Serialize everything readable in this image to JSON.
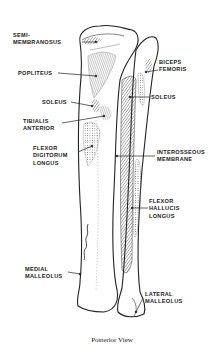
{
  "figure": {
    "caption": "Posterior View",
    "signature": "illustrator signature"
  },
  "labels_left": [
    {
      "id": "semimembranosus",
      "lines": [
        "SEMI-",
        "MEMBRANOSUS"
      ]
    },
    {
      "id": "popliteus",
      "lines": [
        "POPLITEUS"
      ]
    },
    {
      "id": "soleus-left",
      "lines": [
        "SOLEUS"
      ]
    },
    {
      "id": "tibialis-anterior",
      "lines": [
        "TIBIALIS",
        "ANTERIOR"
      ]
    },
    {
      "id": "flexor-digitorum-longus",
      "lines": [
        "FLEXOR",
        "DIGITORUM",
        "LONGUS"
      ]
    },
    {
      "id": "medial-malleolus",
      "lines": [
        "MEDIAL",
        "MALLEOLUS"
      ]
    }
  ],
  "labels_right": [
    {
      "id": "biceps-femoris",
      "lines": [
        "BICEPS",
        "FEMORIS"
      ]
    },
    {
      "id": "soleus-right",
      "lines": [
        "SOLEUS"
      ]
    },
    {
      "id": "interosseous-membrane",
      "lines": [
        "INTEROSSEOUS",
        "MEMBRANE"
      ]
    },
    {
      "id": "flexor-hallucis-longus",
      "lines": [
        "FLEXOR",
        "HALLUCIS",
        "LONGUS"
      ]
    },
    {
      "id": "lateral-malleolus",
      "lines": [
        "LATERAL",
        "MALLEOLUS"
      ]
    }
  ]
}
